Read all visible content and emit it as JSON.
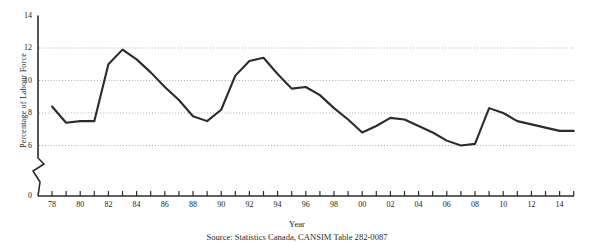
{
  "chart_data": {
    "type": "line",
    "title": "",
    "xlabel": "Year",
    "ylabel": "Percentage of Labour Force",
    "x": [
      1978,
      1979,
      1980,
      1981,
      1982,
      1983,
      1984,
      1985,
      1986,
      1987,
      1988,
      1989,
      1990,
      1991,
      1992,
      1993,
      1994,
      1995,
      1996,
      1997,
      1998,
      1999,
      2000,
      2001,
      2002,
      2003,
      2004,
      2005,
      2006,
      2007,
      2008,
      2009,
      2010,
      2011,
      2012,
      2013,
      2014,
      2015
    ],
    "xtick_labels": [
      "78",
      "80",
      "82",
      "84",
      "86",
      "88",
      "90",
      "92",
      "94",
      "96",
      "98",
      "00",
      "02",
      "04",
      "06",
      "08",
      "10",
      "12",
      "14"
    ],
    "values": [
      8.4,
      7.4,
      7.5,
      7.5,
      11.0,
      11.9,
      11.3,
      10.5,
      9.6,
      8.8,
      7.8,
      7.5,
      8.2,
      10.3,
      11.2,
      11.4,
      10.4,
      9.5,
      9.6,
      9.1,
      8.3,
      7.6,
      6.8,
      7.2,
      7.7,
      7.6,
      7.2,
      6.8,
      6.3,
      6.0,
      6.1,
      8.3,
      8.0,
      7.5,
      7.3,
      7.1,
      6.9,
      6.9
    ],
    "ylim": [
      0,
      14
    ],
    "ytick_labels": [
      "0",
      "6",
      "8",
      "10",
      "12",
      "14"
    ],
    "yticks": [
      0,
      6,
      8,
      10,
      12,
      14
    ],
    "gridlines": [
      6,
      8,
      10,
      12
    ],
    "grid": true,
    "axis_break": true,
    "legend": "none",
    "line_color": "#2b2b2b"
  },
  "axis": {
    "ylabel_text": "Percentage of Labour Force",
    "xlabel_text": "Year"
  },
  "caption": {
    "text": "Source: Statistics Canada, CANSIM Table 282-0087"
  }
}
